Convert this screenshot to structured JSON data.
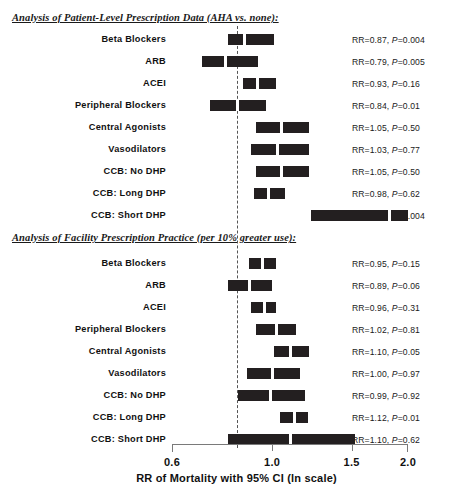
{
  "chart_data": {
    "type": "bar",
    "subtype": "forest-plot",
    "title": "",
    "xlabel": "RR of Mortality with 95% CI (ln scale)",
    "ylabel": "",
    "xlim": [
      0.6,
      2.0
    ],
    "xscale": "log",
    "xticks": [
      0.6,
      1.0,
      1.5,
      2.0
    ],
    "xticklabels": [
      "0.6",
      "1.0",
      "1.5",
      "2.0"
    ],
    "reference_line": 1.0,
    "grid": false,
    "legend": "none",
    "sections": [
      {
        "heading": "Analysis of Patient-Level Prescription Data (AHA vs. none):",
        "rows": [
          {
            "label": "Beta Blockers",
            "rr": 0.87,
            "ci_low": 0.8,
            "ci_high": 1.01,
            "stat": "RR=0.87, P=0.004"
          },
          {
            "label": "ARB",
            "rr": 0.79,
            "ci_low": 0.7,
            "ci_high": 0.93,
            "stat": "RR=0.79, P=0.005"
          },
          {
            "label": "ACEI",
            "rr": 0.93,
            "ci_low": 0.86,
            "ci_high": 1.02,
            "stat": "RR=0.93, P=0.16"
          },
          {
            "label": "Peripheral Blockers",
            "rr": 0.84,
            "ci_low": 0.73,
            "ci_high": 0.97,
            "stat": "RR=0.84, P=0.01"
          },
          {
            "label": "Central Agonists",
            "rr": 1.05,
            "ci_low": 0.92,
            "ci_high": 1.21,
            "stat": "RR=1.05, P=0.50"
          },
          {
            "label": "Vasodilators",
            "rr": 1.03,
            "ci_low": 0.9,
            "ci_high": 1.21,
            "stat": "RR=1.03, P=0.77"
          },
          {
            "label": "CCB: No DHP",
            "rr": 1.05,
            "ci_low": 0.92,
            "ci_high": 1.21,
            "stat": "RR=1.05, P=0.50"
          },
          {
            "label": "CCB: Long DHP",
            "rr": 0.98,
            "ci_low": 0.91,
            "ci_high": 1.07,
            "stat": "RR=0.98, P=0.62"
          },
          {
            "label": "CCB: Short DHP",
            "rr": 1.82,
            "ci_low": 1.22,
            "ci_high": 2.0,
            "stat": "RR=1.82, P=0.004"
          }
        ]
      },
      {
        "heading": "Analysis of Facility Prescription Practice (per 10% greater use):",
        "rows": [
          {
            "label": "Beta Blockers",
            "rr": 0.95,
            "ci_low": 0.89,
            "ci_high": 1.02,
            "stat": "RR=0.95, P=0.15"
          },
          {
            "label": "ARB",
            "rr": 0.89,
            "ci_low": 0.8,
            "ci_high": 1.0,
            "stat": "RR=0.89, P=0.06"
          },
          {
            "label": "ACEI",
            "rr": 0.96,
            "ci_low": 0.9,
            "ci_high": 1.02,
            "stat": "RR=0.96, P=0.31"
          },
          {
            "label": "Peripheral Blockers",
            "rr": 1.02,
            "ci_low": 0.92,
            "ci_high": 1.13,
            "stat": "RR=1.02, P=0.81"
          },
          {
            "label": "Central Agonists",
            "rr": 1.1,
            "ci_low": 1.01,
            "ci_high": 1.21,
            "stat": "RR=1.10, P=0.05"
          },
          {
            "label": "Vasodilators",
            "rr": 1.0,
            "ci_low": 0.88,
            "ci_high": 1.15,
            "stat": "RR=1.00, P=0.97"
          },
          {
            "label": "CCB: No DHP",
            "rr": 0.99,
            "ci_low": 0.84,
            "ci_high": 1.18,
            "stat": "RR=0.99, P=0.92"
          },
          {
            "label": "CCB: Long DHP",
            "rr": 1.12,
            "ci_low": 1.04,
            "ci_high": 1.2,
            "stat": "RR=1.12, P=0.01"
          },
          {
            "label": "CCB: Short DHP",
            "rr": 1.1,
            "ci_low": 0.8,
            "ci_high": 1.53,
            "stat": "RR=1.10, P=0.62"
          }
        ]
      }
    ],
    "colors": {
      "bar": "#231f20",
      "point_marker": "#ffffff",
      "reference_line": "#555555",
      "axis": "#7a7a7a",
      "text": "#111111",
      "background": "#ffffff"
    }
  }
}
